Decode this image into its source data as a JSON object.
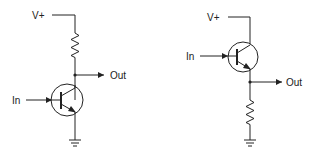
{
  "diagram": {
    "circuits": [
      {
        "name": "common-emitter",
        "supply_label": "V+",
        "input_label": "In",
        "output_label": "Out",
        "components": [
          "resistor (collector load)",
          "NPN transistor",
          "ground"
        ]
      },
      {
        "name": "emitter-follower",
        "supply_label": "V+",
        "input_label": "In",
        "output_label": "Out",
        "components": [
          "NPN transistor",
          "resistor (emitter load)",
          "ground"
        ]
      }
    ]
  },
  "colors": {
    "line": "#222222",
    "background": "#ffffff"
  }
}
